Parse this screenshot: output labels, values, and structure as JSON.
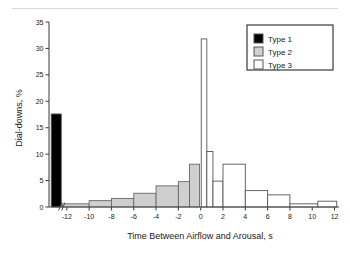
{
  "figure": {
    "background_color": "#ffffff",
    "has_top_rule": true
  },
  "chart_data": {
    "type": "bar",
    "title": "",
    "subtitle": "",
    "xlabel": "Time Between Airflow and Arousal, s",
    "ylabel": "Dial-downs, %",
    "xlim": [
      -13.6,
      12.4
    ],
    "ylim": [
      0,
      35
    ],
    "xticks": [
      -12,
      -10,
      -8,
      -6,
      -4,
      -2,
      0,
      2,
      4,
      6,
      8,
      10,
      12
    ],
    "xtick_labels": [
      "-12",
      "-10",
      "-8",
      "-6",
      "-4",
      "-2",
      "0",
      "2",
      "4",
      "6",
      "8",
      "10",
      "12"
    ],
    "yticks": [
      0,
      5,
      10,
      15,
      20,
      25,
      30,
      35
    ],
    "ytick_labels": [
      "0",
      "5",
      "10",
      "15",
      "20",
      "25",
      "30",
      "35"
    ],
    "grid": false,
    "axis_break": {
      "present": true,
      "symbol": "//",
      "position_x": -12.6,
      "axis": "x"
    },
    "legend": {
      "position": "top-right",
      "entries": [
        {
          "name": "Type 1",
          "fill": "#000000",
          "stroke": "#555555"
        },
        {
          "name": "Type 2",
          "fill": "#cfcfcf",
          "stroke": "#555555"
        },
        {
          "name": "Type 3",
          "fill": "#ffffff",
          "stroke": "#555555"
        }
      ]
    },
    "series": [
      {
        "name": "Type 1",
        "fill": "#000000",
        "stroke": "#555555",
        "bars": [
          {
            "x0": -13.4,
            "x1": -12.5,
            "value": 17.6
          }
        ]
      },
      {
        "name": "Type 2",
        "fill": "#cfcfcf",
        "stroke": "#666666",
        "bars": [
          {
            "x0": -12.4,
            "x1": -10.0,
            "value": 0.6
          },
          {
            "x0": -10.0,
            "x1": -8.0,
            "value": 1.2
          },
          {
            "x0": -8.0,
            "x1": -6.0,
            "value": 1.6
          },
          {
            "x0": -6.0,
            "x1": -4.0,
            "value": 2.6
          },
          {
            "x0": -4.0,
            "x1": -2.0,
            "value": 4.0
          },
          {
            "x0": -2.0,
            "x1": -1.0,
            "value": 4.8
          },
          {
            "x0": -1.0,
            "x1": -0.1,
            "value": 8.1
          }
        ]
      },
      {
        "name": "Type 3",
        "fill": "#ffffff",
        "stroke": "#555555",
        "bars": [
          {
            "x0": 0.05,
            "x1": 0.55,
            "value": 31.8
          },
          {
            "x0": 0.55,
            "x1": 1.1,
            "value": 10.5
          },
          {
            "x0": 1.1,
            "x1": 2.0,
            "value": 4.9
          },
          {
            "x0": 2.0,
            "x1": 4.0,
            "value": 8.1
          },
          {
            "x0": 4.0,
            "x1": 6.0,
            "value": 3.1
          },
          {
            "x0": 6.0,
            "x1": 8.0,
            "value": 2.3
          },
          {
            "x0": 8.0,
            "x1": 10.5,
            "value": 0.6
          },
          {
            "x0": 10.5,
            "x1": 12.2,
            "value": 1.1
          }
        ]
      }
    ]
  }
}
